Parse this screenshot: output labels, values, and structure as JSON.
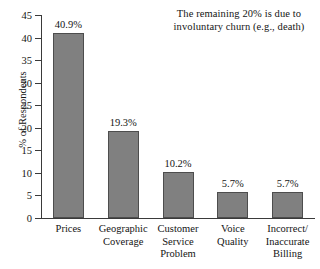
{
  "chart_data": {
    "type": "bar",
    "title": "",
    "xlabel": "",
    "ylabel": "% of Respondents",
    "ylim": [
      0,
      45
    ],
    "ytick_step": 5,
    "yticks": [
      0,
      5,
      10,
      15,
      20,
      25,
      30,
      35,
      40,
      45
    ],
    "ytick_labels": [
      "0",
      "5",
      "10",
      "15",
      "20",
      "25",
      "30",
      "35",
      "40",
      "45"
    ],
    "grid": false,
    "legend": null,
    "categories": [
      "Prices",
      "Geographic Coverage",
      "Customer Service Problem",
      "Voice Quality",
      "Incorrect/Inaccurate Billing"
    ],
    "category_lines": [
      [
        "Prices"
      ],
      [
        "Geographic",
        "Coverage"
      ],
      [
        "Customer",
        "Service",
        "Problem"
      ],
      [
        "Voice",
        "Quality"
      ],
      [
        "Incorrect/",
        "Inaccurate",
        "Billing"
      ]
    ],
    "values": [
      40.9,
      19.3,
      10.2,
      5.7,
      5.7
    ],
    "value_labels": [
      "40.9%",
      "19.3%",
      "10.2%",
      "5.7%",
      "5.7%"
    ],
    "bar_color": "#808080",
    "bar_edge_color": "#4d4d4d",
    "axis_color": "#3a3a3a",
    "annotation": {
      "lines": [
        "The remaining 20% is due to",
        "involuntary churn (e.g., death)"
      ],
      "text": "The remaining 20% is due to involuntary churn (e.g., death)"
    }
  }
}
